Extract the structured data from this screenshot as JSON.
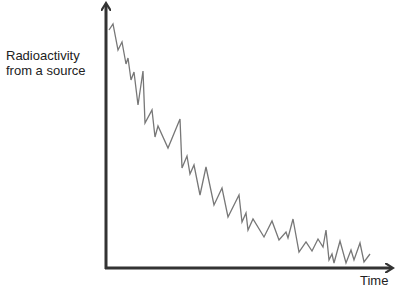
{
  "chart_data": {
    "type": "line",
    "title": "",
    "xlabel": "Time",
    "ylabel": "Radioactivity from a source",
    "ylabel_lines": [
      "Radioactivity",
      "from a source"
    ],
    "grid": false,
    "legend": null,
    "axis_ticks": false,
    "line_color": "#777777",
    "axis_color": "#333333",
    "pixel_points": [
      [
        109,
        30
      ],
      [
        113,
        24
      ],
      [
        118,
        50
      ],
      [
        122,
        42
      ],
      [
        126,
        64
      ],
      [
        128,
        58
      ],
      [
        131,
        80
      ],
      [
        134,
        72
      ],
      [
        138,
        105
      ],
      [
        143,
        71
      ],
      [
        145,
        123
      ],
      [
        152,
        110
      ],
      [
        155,
        137
      ],
      [
        158,
        126
      ],
      [
        168,
        148
      ],
      [
        180,
        119
      ],
      [
        182,
        168
      ],
      [
        187,
        156
      ],
      [
        190,
        174
      ],
      [
        194,
        165
      ],
      [
        200,
        195
      ],
      [
        206,
        167
      ],
      [
        214,
        205
      ],
      [
        222,
        188
      ],
      [
        228,
        217
      ],
      [
        239,
        195
      ],
      [
        242,
        222
      ],
      [
        246,
        213
      ],
      [
        248,
        230
      ],
      [
        253,
        219
      ],
      [
        264,
        237
      ],
      [
        272,
        221
      ],
      [
        279,
        240
      ],
      [
        286,
        232
      ],
      [
        288,
        238
      ],
      [
        293,
        219
      ],
      [
        299,
        252
      ],
      [
        306,
        242
      ],
      [
        312,
        251
      ],
      [
        318,
        239
      ],
      [
        323,
        247
      ],
      [
        326,
        230
      ],
      [
        329,
        260
      ],
      [
        332,
        254
      ],
      [
        334,
        263
      ],
      [
        340,
        241
      ],
      [
        346,
        263
      ],
      [
        351,
        250
      ],
      [
        354,
        260
      ],
      [
        360,
        243
      ],
      [
        364,
        262
      ],
      [
        370,
        254
      ]
    ],
    "origin_px": [
      106,
      268
    ],
    "x_axis_end_px": 394,
    "y_axis_top_px": 2
  }
}
